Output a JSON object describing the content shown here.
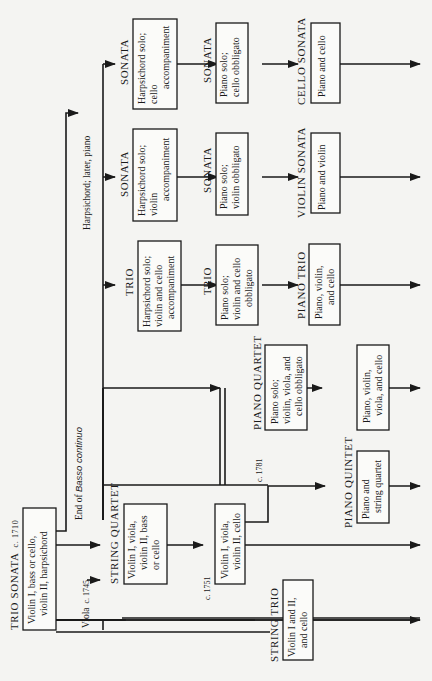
{
  "diagram": {
    "orientation": "rotated-90-ccw",
    "title_node": {
      "heading": "TRIO SONATA",
      "date": "c. 1710",
      "body": [
        "Violin I, bass or cello,",
        "violin II, harpsichord"
      ]
    },
    "annotations": {
      "end_basso_prefix": "End of",
      "end_basso_italic": "Basso continuo",
      "viola_note": "Viola",
      "viola_date": "c. 1745",
      "harpsichord_later_piano": "Harpsichord; later, piano",
      "date_1751": "c. 1751",
      "date_1781": "c. 1781"
    },
    "nodes": {
      "string_quartet": {
        "heading": "STRING QUARTET",
        "body": [
          "Violin I, viola,",
          "violin II, bass",
          "or cello"
        ]
      },
      "string_quartet_1751": {
        "body": [
          "Violin I, viola,",
          "violin II, cello"
        ]
      },
      "string_trio": {
        "heading": "STRING TRIO",
        "body": [
          "Violin I and II,",
          "and cello"
        ]
      },
      "piano_quintet": {
        "heading": "PIANO QUINTET",
        "body": [
          "Piano and",
          "string quartet"
        ]
      },
      "piano_quartet": {
        "heading": "PIANO QUARTET",
        "body": [
          "Piano solo;",
          "violin, viola, and",
          "cello obbligato"
        ]
      },
      "piano_quartet_final": {
        "body": [
          "Piano, violin,",
          "viola, and cello"
        ]
      },
      "trio_harpsichord": {
        "heading": "TRIO",
        "body": [
          "Harpsichord solo;",
          "violin and cello",
          "accompaniment"
        ]
      },
      "trio_piano": {
        "heading": "TRIO",
        "body": [
          "Piano solo;",
          "violin and cello",
          "obbligato"
        ]
      },
      "piano_trio": {
        "heading": "PIANO TRIO",
        "body": [
          "Piano, violin,",
          "and cello"
        ]
      },
      "sonata_violin_harpsichord": {
        "heading": "SONATA",
        "body": [
          "Harpsichord solo;",
          "violin",
          "accompaniment"
        ]
      },
      "sonata_violin_piano": {
        "heading": "SONATA",
        "body": [
          "Piano solo;",
          "violin obbligato"
        ]
      },
      "violin_sonata": {
        "heading": "VIOLIN SONATA",
        "body": [
          "Piano and violin"
        ]
      },
      "sonata_cello_harpsichord": {
        "heading": "SONATA",
        "body": [
          "Harpsichord solo;",
          "cello",
          "accompaniment"
        ]
      },
      "sonata_cello_piano": {
        "heading": "SONATA",
        "body": [
          "Piano solo;",
          "cello obbligato"
        ]
      },
      "cello_sonata": {
        "heading": "CELLO SONATA",
        "body": [
          "Piano and cello"
        ]
      }
    }
  }
}
